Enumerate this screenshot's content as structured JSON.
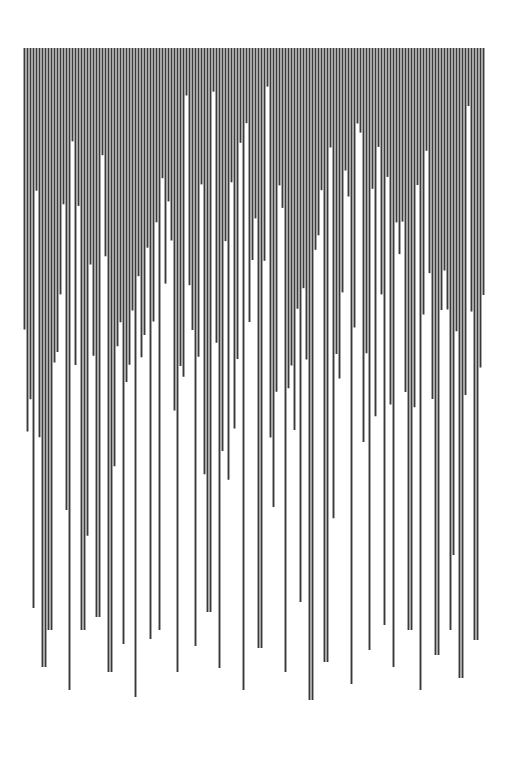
{
  "artwork": {
    "title": "",
    "background": "#ffffff",
    "stroke_color": "#3a3a3a",
    "top_y": 48,
    "x_start": 24.5,
    "x_end": 484.5,
    "spacing": 3.0,
    "stroke_width": 1.9,
    "min_end_y": 60,
    "max_end_y": 700,
    "long_lines": [
      {
        "x": 34,
        "end_y": 608
      },
      {
        "x": 44,
        "end_y": 667
      },
      {
        "x": 50,
        "end_y": 630
      },
      {
        "x": 69,
        "end_y": 690
      },
      {
        "x": 83,
        "end_y": 630
      },
      {
        "x": 98,
        "end_y": 617
      },
      {
        "x": 110,
        "end_y": 672
      },
      {
        "x": 124,
        "end_y": 644
      },
      {
        "x": 135,
        "end_y": 697
      },
      {
        "x": 150,
        "end_y": 639
      },
      {
        "x": 160,
        "end_y": 630
      },
      {
        "x": 177,
        "end_y": 672
      },
      {
        "x": 195,
        "end_y": 646
      },
      {
        "x": 209,
        "end_y": 612
      },
      {
        "x": 220,
        "end_y": 668
      },
      {
        "x": 244,
        "end_y": 690
      },
      {
        "x": 260,
        "end_y": 648
      },
      {
        "x": 286,
        "end_y": 672
      },
      {
        "x": 300,
        "end_y": 602
      },
      {
        "x": 311,
        "end_y": 700
      },
      {
        "x": 326,
        "end_y": 662
      },
      {
        "x": 352,
        "end_y": 684
      },
      {
        "x": 369,
        "end_y": 650
      },
      {
        "x": 384,
        "end_y": 625
      },
      {
        "x": 393,
        "end_y": 667
      },
      {
        "x": 410,
        "end_y": 630
      },
      {
        "x": 421,
        "end_y": 690
      },
      {
        "x": 437,
        "end_y": 655
      },
      {
        "x": 450,
        "end_y": 630
      },
      {
        "x": 461,
        "end_y": 678
      },
      {
        "x": 476,
        "end_y": 640
      }
    ],
    "right_short_line": {
      "x": 483.5,
      "end_y": 295
    }
  }
}
